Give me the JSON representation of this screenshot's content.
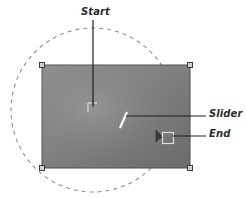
{
  "figure": {
    "background_color": "#ffffff",
    "labels": {
      "start": "Start",
      "slider": "Slider",
      "end": "End"
    },
    "annotations": [
      {
        "name": "start",
        "text": "Start",
        "target_x": 93,
        "target_y": 107
      },
      {
        "name": "slider",
        "text": "Slider",
        "target_x": 124,
        "target_y": 118
      },
      {
        "name": "end",
        "text": "End",
        "target_x": 168,
        "target_y": 138
      }
    ],
    "canvas_rect": {
      "x": 42,
      "y": 65,
      "width": 148,
      "height": 103,
      "fill_from": "#8f8f8f",
      "fill_to": "#6f6f6f",
      "border_color": "#4a4a4a",
      "handle_fill": "#c9c9c9",
      "handle_border": "#3d3d3d",
      "handle_size": 5
    },
    "dashed_circle": {
      "center_x": 93,
      "center_y": 110,
      "radius": 82,
      "stroke": "#8a8a8a",
      "dash": "4 4"
    },
    "start_marker": {
      "x": 93,
      "y": 107,
      "type": "crosshair-marker"
    },
    "slider_marker": {
      "x": 124,
      "y": 120,
      "type": "tick-mark",
      "color": "#f2f2f2"
    },
    "end_marker": {
      "x": 168,
      "y": 138,
      "type": "square-handle",
      "cursor_x": 159,
      "cursor_y": 133
    },
    "leader_color": "#1e1e1e"
  }
}
